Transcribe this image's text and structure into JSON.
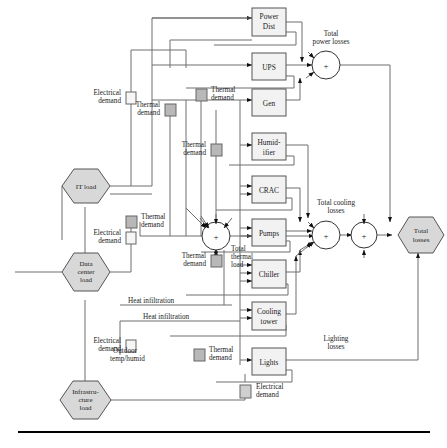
{
  "figure": {
    "type": "block-diagram"
  },
  "blocks": [
    {
      "id": "power-dist",
      "label_lines": [
        "Power",
        "Dist"
      ]
    },
    {
      "id": "ups",
      "label_lines": [
        "UPS"
      ]
    },
    {
      "id": "gen",
      "label_lines": [
        "Gen"
      ]
    },
    {
      "id": "humidifier",
      "label_lines": [
        "Humid-",
        "ifier"
      ]
    },
    {
      "id": "crac",
      "label_lines": [
        "CRAC"
      ]
    },
    {
      "id": "pumps",
      "label_lines": [
        "Pumps"
      ]
    },
    {
      "id": "chiller",
      "label_lines": [
        "Chiller"
      ]
    },
    {
      "id": "cooling-tower",
      "label_lines": [
        "Cooling",
        "tower"
      ]
    },
    {
      "id": "lights",
      "label_lines": [
        "Lights"
      ]
    }
  ],
  "hexagons": [
    {
      "id": "it-load",
      "label_lines": [
        "IT load"
      ]
    },
    {
      "id": "data-center-load",
      "label_lines": [
        "Data",
        "center",
        "load"
      ]
    },
    {
      "id": "infrastructure-load",
      "label_lines": [
        "Infrastru-",
        "cture",
        "load"
      ]
    },
    {
      "id": "total-losses",
      "label_lines": [
        "Total",
        "losses"
      ]
    }
  ],
  "junctions": [
    {
      "id": "total-power-losses",
      "symbol": "+",
      "label_lines": [
        "Total",
        "power losses"
      ]
    },
    {
      "id": "total-cooling-losses",
      "symbol": "+",
      "label_lines": [
        "Total cooling",
        "losses"
      ]
    },
    {
      "id": "total-thermal-load",
      "symbol": "+",
      "label_lines": [
        "Total",
        "thermal",
        "load"
      ]
    },
    {
      "id": "total-sum",
      "symbol": "+",
      "label_lines": []
    }
  ],
  "signal_labels": [
    {
      "id": "electrical-demand-it",
      "lines": [
        "Electrical",
        "demand"
      ],
      "marker": "white"
    },
    {
      "id": "thermal-demand-it",
      "lines": [
        "Thermal",
        "demand"
      ],
      "marker": "gray"
    },
    {
      "id": "thermal-demand-upper-right",
      "lines": [
        "Thermal",
        "demand"
      ],
      "marker": "gray"
    },
    {
      "id": "thermal-demand-mid-right",
      "lines": [
        "Thermal",
        "demand"
      ],
      "marker": "gray"
    },
    {
      "id": "electrical-demand-dc",
      "lines": [
        "Electrical",
        "demand"
      ],
      "marker": "white"
    },
    {
      "id": "thermal-demand-left",
      "lines": [
        "Thermal",
        "demand"
      ],
      "marker": "gray"
    },
    {
      "id": "thermal-demand-center",
      "lines": [
        "Thermal",
        "demand"
      ],
      "marker": "gray"
    },
    {
      "id": "electrical-demand-infra",
      "lines": [
        "Electrical",
        "demand"
      ],
      "marker": "white"
    },
    {
      "id": "thermal-demand-bottom",
      "lines": [
        "Thermal",
        "demand"
      ],
      "marker": "gray"
    },
    {
      "id": "electrical-demand-bottom",
      "lines": [
        "Electrical",
        "demand"
      ],
      "marker": "gray"
    },
    {
      "id": "heat-infiltration-1",
      "lines": [
        "Heat infiltration"
      ],
      "marker": "none"
    },
    {
      "id": "heat-infiltration-2",
      "lines": [
        "Heat infiltration"
      ],
      "marker": "none"
    },
    {
      "id": "outdoor-temp-humid",
      "lines": [
        "Outdoor",
        "temp/humid"
      ],
      "marker": "none"
    },
    {
      "id": "lighting-losses",
      "lines": [
        "Lighting",
        "losses"
      ],
      "marker": "none"
    }
  ],
  "colors": {
    "line": "#6e6e6e",
    "arrow": "#111111",
    "box_fill": "#f2f2f2",
    "box_stroke": "#555555",
    "hex_fill": "#d8d8d8",
    "hex_stroke": "#555555",
    "marker_white": "#f6f6f6",
    "marker_gray": "#b8b8b8",
    "text": "#1a1a1a",
    "rule": "#000000"
  }
}
